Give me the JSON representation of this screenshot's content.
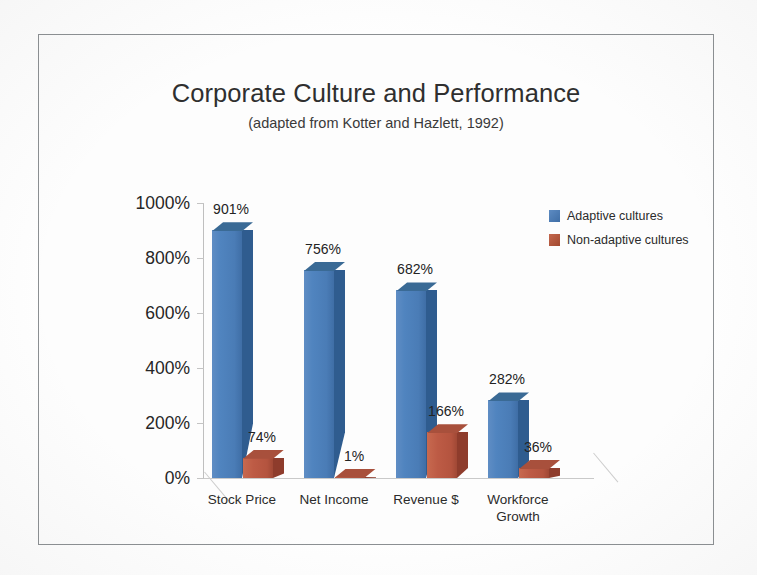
{
  "chart_data": {
    "type": "bar",
    "title": "Corporate Culture and Performance",
    "subtitle": "(adapted from Kotter and Hazlett, 1992)",
    "xlabel": "",
    "ylabel": "",
    "ylim": [
      0,
      1000
    ],
    "y_tick_labels": [
      "1000%",
      "800%",
      "600%",
      "400%",
      "200%",
      "0%"
    ],
    "y_tick_values": [
      1000,
      800,
      600,
      400,
      200,
      0
    ],
    "grid": false,
    "legend_position": "top-right",
    "three_d": true,
    "categories": [
      "Stock Price",
      "Net Income",
      "Revenue $",
      "Workforce Growth"
    ],
    "category_label_lines": [
      [
        "Stock Price"
      ],
      [
        "Net Income"
      ],
      [
        "Revenue $"
      ],
      [
        "Workforce",
        "Growth"
      ]
    ],
    "series": [
      {
        "name": "Adaptive cultures",
        "color": "#4F81BD",
        "values": [
          901,
          756,
          682,
          282
        ],
        "data_labels": [
          "901%",
          "756%",
          "682%",
          "282%"
        ]
      },
      {
        "name": "Non-adaptive cultures",
        "color": "#C0504D",
        "values": [
          74,
          1,
          166,
          36
        ],
        "data_labels": [
          "74%",
          "1%",
          "166%",
          "36%"
        ]
      }
    ]
  },
  "legend": {
    "items": [
      {
        "label": "Adaptive cultures",
        "color": "#4F81BD"
      },
      {
        "label": "Non-adaptive cultures",
        "color": "#C0504D"
      }
    ]
  },
  "colors": {
    "series_a": "#4F81BD",
    "series_b": "#C0504D",
    "axis": "#BFBFBF",
    "text": "#262626",
    "frame": "#8B8F92",
    "page": "#FFFFFF"
  }
}
